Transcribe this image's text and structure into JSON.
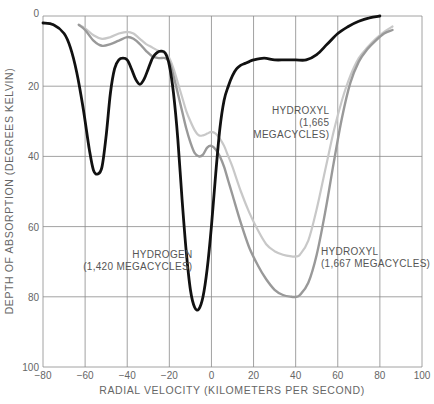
{
  "chart_data": {
    "type": "line",
    "title": "",
    "xlabel": "RADIAL VELOCITY (KILOMETERS PER SECOND)",
    "ylabel": "DEPTH OF ABSORPTION (DEGREES KELVIN)",
    "xlim": [
      -80,
      100
    ],
    "ylim": [
      0,
      100
    ],
    "y_inverted": true,
    "grid": true,
    "x_ticks": [
      -80,
      -60,
      -40,
      -20,
      0,
      20,
      40,
      60,
      80,
      100
    ],
    "x_tick_labels": [
      "−80",
      "−60",
      "−40",
      "−20",
      "0",
      "20",
      "40",
      "60",
      "80",
      "100"
    ],
    "y_ticks": [
      0,
      20,
      40,
      60,
      80,
      100
    ],
    "y_tick_labels": [
      "0",
      "20",
      "40",
      "60",
      "80",
      "100"
    ],
    "series": [
      {
        "name": "Hydrogen (1,420 megacycles)",
        "color": "#111111",
        "width": 2.8,
        "x": [
          -80,
          -75,
          -70,
          -67,
          -64,
          -61,
          -58,
          -56,
          -54,
          -52,
          -50,
          -48,
          -46,
          -44,
          -42,
          -40,
          -38,
          -36,
          -34,
          -32,
          -30,
          -28,
          -26,
          -24,
          -22,
          -20,
          -18,
          -16,
          -14,
          -12,
          -10,
          -8,
          -6,
          -4,
          -2,
          0,
          2,
          4,
          6,
          8,
          10,
          12,
          14,
          16,
          18,
          20,
          25,
          30,
          35,
          40,
          45,
          50,
          55,
          60,
          65,
          70,
          75,
          80
        ],
        "y": [
          2,
          2.5,
          5,
          9,
          16,
          26,
          38,
          44,
          45,
          43,
          34,
          22,
          15,
          12.5,
          12,
          12.5,
          15,
          18,
          19.5,
          18,
          15,
          12,
          10.5,
          10,
          10.5,
          14,
          22,
          35,
          52,
          67,
          78,
          83,
          83.5,
          80,
          72,
          60,
          45,
          32,
          24,
          20,
          17,
          15,
          14,
          13.5,
          13,
          12.5,
          12,
          12.5,
          12.5,
          12.5,
          12.5,
          11,
          8,
          5,
          3,
          1.5,
          0.5,
          0
        ]
      },
      {
        "name": "Hydroxyl (1,665 megacycles)",
        "color": "#c8c8c8",
        "width": 2.2,
        "x": [
          -63,
          -60,
          -56,
          -52,
          -48,
          -44,
          -40,
          -37,
          -34,
          -31,
          -28,
          -25,
          -22,
          -20,
          -18,
          -16,
          -14,
          -12,
          -10,
          -8,
          -6,
          -4,
          -2,
          0,
          2,
          4,
          6,
          8,
          10,
          14,
          18,
          22,
          26,
          30,
          34,
          38,
          40,
          42,
          46,
          50,
          54,
          58,
          62,
          66,
          70,
          74,
          78,
          82,
          86
        ],
        "y": [
          2.5,
          3.5,
          5.5,
          6.5,
          6,
          5,
          4.5,
          5,
          6.5,
          8,
          9,
          10,
          10.5,
          12,
          15,
          19,
          23,
          27,
          30,
          32.5,
          34,
          34,
          33.5,
          33,
          33.5,
          35,
          37,
          40,
          43,
          50,
          56,
          61,
          65,
          67,
          68,
          68.5,
          68.5,
          68,
          64,
          55,
          44,
          33,
          24,
          17,
          12,
          9,
          6.5,
          4.5,
          3
        ]
      },
      {
        "name": "Hydroxyl (1,667 megacycles)",
        "color": "#999999",
        "width": 2.4,
        "x": [
          -63,
          -60,
          -56,
          -52,
          -48,
          -44,
          -40,
          -37,
          -34,
          -31,
          -28,
          -25,
          -22,
          -20,
          -18,
          -16,
          -14,
          -12,
          -10,
          -8,
          -6,
          -4,
          -2,
          0,
          2,
          4,
          6,
          8,
          10,
          14,
          18,
          22,
          26,
          30,
          34,
          38,
          40,
          42,
          46,
          50,
          54,
          58,
          62,
          66,
          70,
          74,
          78,
          82,
          86
        ],
        "y": [
          2.5,
          4,
          7,
          8.5,
          8,
          7,
          6,
          6.5,
          8,
          10,
          11.5,
          12,
          12,
          13,
          17,
          22,
          27,
          32,
          36,
          39,
          40,
          39.5,
          37.5,
          37,
          38,
          40,
          43,
          47,
          51,
          59,
          66,
          71,
          75,
          78,
          79.5,
          80,
          80,
          79.5,
          76,
          68,
          56,
          42,
          29,
          19,
          13,
          9.5,
          7,
          5,
          4
        ]
      }
    ],
    "annotations": [
      {
        "lines": [
          "HYDROXYL",
          "(1,665",
          "MEGACYCLES)"
        ],
        "x": 56,
        "y": 28,
        "align": "right"
      },
      {
        "lines": [
          "HYDROGEN",
          "(1,420 MEGACYCLES)"
        ],
        "x": -9,
        "y": 69,
        "align": "right"
      },
      {
        "lines": [
          "HYDROXYL",
          "(1,667 MEGACYCLES)"
        ],
        "x": 52,
        "y": 68,
        "align": "left"
      }
    ],
    "legend": null
  }
}
